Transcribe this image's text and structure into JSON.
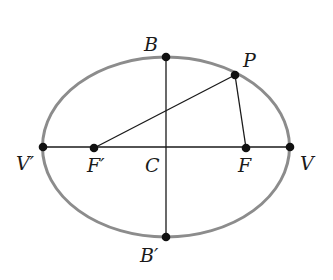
{
  "diagram": {
    "colors": {
      "ellipse": "#8c8c8c",
      "lines": "#1a1a1a",
      "points": "#111111",
      "background": "#ffffff"
    },
    "ellipse": {
      "cx": 166,
      "cy": 147,
      "rx": 123.5,
      "ry": 90
    },
    "points": {
      "B": {
        "label": "B",
        "x": 166,
        "y": 57
      },
      "B_prime": {
        "label": "B′",
        "x": 166,
        "y": 237
      },
      "V": {
        "label": "V",
        "x": 290,
        "y": 147
      },
      "V_prime": {
        "label": "V′",
        "x": 43,
        "y": 147
      },
      "F": {
        "label": "F",
        "x": 246,
        "y": 148
      },
      "F_prime": {
        "label": "F′",
        "x": 94,
        "y": 148
      },
      "C": {
        "label": "C",
        "x": 166,
        "y": 147
      },
      "P": {
        "label": "P",
        "x": 235,
        "y": 75
      }
    },
    "segments": [
      {
        "name": "major-axis",
        "from": "V_prime",
        "to": "V"
      },
      {
        "name": "minor-axis",
        "from": "B",
        "to": "B_prime"
      },
      {
        "name": "focal-radius-PF-prime",
        "from": "P",
        "to": "F_prime"
      },
      {
        "name": "focal-radius-PF",
        "from": "P",
        "to": "F"
      }
    ]
  }
}
